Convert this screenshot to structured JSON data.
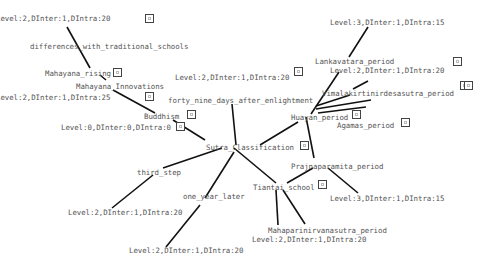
{
  "diagram": {
    "edge_color": "#111111",
    "label_color": "#555555",
    "nodes": [
      {
        "id": "n1",
        "label": "Level:2,DInter:1,DIntra:20",
        "x": -4,
        "y": 14
      },
      {
        "id": "n2",
        "label": "differences_with_traditional_schools",
        "x": 30,
        "y": 42
      },
      {
        "id": "n3",
        "label": "Mahayana_rising",
        "x": 45,
        "y": 69
      },
      {
        "id": "n4",
        "label": "Mahayana_Innovations",
        "x": 76,
        "y": 82
      },
      {
        "id": "n5",
        "label": "Level:2,DInter:1,DIntra:25",
        "x": -4,
        "y": 93
      },
      {
        "id": "n6",
        "label": "Buddhism",
        "x": 144,
        "y": 112
      },
      {
        "id": "n7",
        "label": "Level:0,DInter:0,DIntra:0",
        "x": 61,
        "y": 123
      },
      {
        "id": "n8",
        "label": "Level:2,DInter:1,DIntra:20",
        "x": 175,
        "y": 73
      },
      {
        "id": "n9",
        "label": "forty_nine_days_after_enlightment",
        "x": 168,
        "y": 96
      },
      {
        "id": "n10",
        "label": "Level:3,DInter:1,DIntra:15",
        "x": 330,
        "y": 18
      },
      {
        "id": "n11",
        "label": "Lankavatara_period",
        "x": 315,
        "y": 57
      },
      {
        "id": "n12",
        "label": "Level:2,DInter:1,DIntra:20",
        "x": 330,
        "y": 66
      },
      {
        "id": "n13",
        "label": "Vimalakirtinirdesasutra_period",
        "x": 322,
        "y": 89
      },
      {
        "id": "n14",
        "label": "Huayan_period",
        "x": 291,
        "y": 113
      },
      {
        "id": "n15",
        "label": "Agamas_period",
        "x": 337,
        "y": 121
      },
      {
        "id": "n16",
        "label": "Sutra_Classification",
        "x": 206,
        "y": 143
      },
      {
        "id": "n17",
        "label": "third_step",
        "x": 137,
        "y": 168
      },
      {
        "id": "n18",
        "label": "one_year_later",
        "x": 183,
        "y": 192
      },
      {
        "id": "n19",
        "label": "Prajnaparamita_period",
        "x": 291,
        "y": 162
      },
      {
        "id": "n20",
        "label": "Tiantai_school",
        "x": 253,
        "y": 183
      },
      {
        "id": "n21",
        "label": "Level:3,DInter:1,DIntra:15",
        "x": 330,
        "y": 194
      },
      {
        "id": "n22",
        "label": "Level:2,DInter:1,DIntra:20",
        "x": 68,
        "y": 208
      },
      {
        "id": "n23",
        "label": "Mahaparinirvanasutra_period",
        "x": 268,
        "y": 226
      },
      {
        "id": "n24",
        "label": "Level:2,DInter:1,DIntra:20",
        "x": 252,
        "y": 235
      },
      {
        "id": "n25",
        "label": "Level:2,DInter:1,DIntra:20",
        "x": 129,
        "y": 246
      }
    ],
    "badges": [
      {
        "near": "n1",
        "x": 145,
        "y": 14
      },
      {
        "near": "n3",
        "x": 113,
        "y": 68
      },
      {
        "near": "n5",
        "x": 145,
        "y": 92
      },
      {
        "near": "n6",
        "x": 187,
        "y": 110
      },
      {
        "near": "n7",
        "x": 176,
        "y": 122
      },
      {
        "near": "n8",
        "x": 294,
        "y": 67
      },
      {
        "near": "n11",
        "x": 453,
        "y": 57
      },
      {
        "near": "n13",
        "x": 460,
        "y": 81
      },
      {
        "near": "n13b",
        "x": 464,
        "y": 81
      },
      {
        "near": "n14",
        "x": 352,
        "y": 110
      },
      {
        "near": "n15",
        "x": 401,
        "y": 118
      },
      {
        "near": "n16",
        "x": 300,
        "y": 141
      },
      {
        "near": "n20",
        "x": 318,
        "y": 180
      }
    ],
    "edges": [
      [
        67,
        27,
        90,
        68
      ],
      [
        100,
        75,
        106,
        80
      ],
      [
        113,
        90,
        155,
        113
      ],
      [
        173,
        120,
        205,
        140
      ],
      [
        232,
        104,
        236,
        145
      ],
      [
        222,
        148,
        163,
        168
      ],
      [
        153,
        175,
        112,
        208
      ],
      [
        234,
        152,
        205,
        198
      ],
      [
        200,
        205,
        166,
        247
      ],
      [
        234,
        148,
        276,
        183
      ],
      [
        260,
        145,
        298,
        122
      ],
      [
        306,
        117,
        314,
        158
      ],
      [
        313,
        168,
        287,
        183
      ],
      [
        328,
        168,
        358,
        193
      ],
      [
        276,
        190,
        278,
        225
      ],
      [
        283,
        190,
        305,
        224
      ],
      [
        368,
        27,
        349,
        57
      ],
      [
        339,
        72,
        311,
        114
      ],
      [
        368,
        81,
        353,
        89
      ],
      [
        316,
        109,
        371,
        100
      ],
      [
        318,
        113,
        366,
        107
      ],
      [
        316,
        106,
        350,
        95
      ]
    ]
  }
}
